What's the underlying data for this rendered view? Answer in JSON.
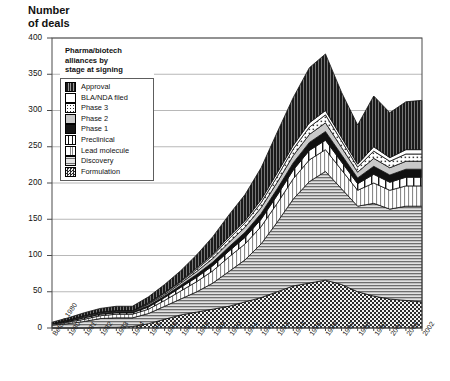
{
  "axis_title": "Number\nof deals",
  "legend": {
    "title": "Pharma/biotech\nalliances by\nstage at signing",
    "items": [
      {
        "label": "Approval",
        "pattern": "vstripe-dark"
      },
      {
        "label": "BLA/NDA filed",
        "pattern": "white"
      },
      {
        "label": "Phase 3",
        "pattern": "dot-grid"
      },
      {
        "label": "Phase 2",
        "pattern": "light-gray"
      },
      {
        "label": "Phase 1",
        "pattern": "solid-black"
      },
      {
        "label": "Preclinical",
        "pattern": "wide-vbar"
      },
      {
        "label": "Lead molecule",
        "pattern": "vstripe-light"
      },
      {
        "label": "Discovery",
        "pattern": "hstripe"
      },
      {
        "label": "Formulation",
        "pattern": "checker"
      }
    ]
  },
  "chart_data": {
    "type": "area",
    "title": "Pharma/biotech alliances by stage at signing",
    "xlabel": "",
    "ylabel": "Number of deals",
    "ylim": [
      0,
      400
    ],
    "yticks": [
      0,
      50,
      100,
      150,
      200,
      250,
      300,
      350,
      400
    ],
    "grid": true,
    "stacked": true,
    "legend_position": "upper-left-inside",
    "categories": [
      "Before 1980",
      "1980",
      "1981",
      "1982",
      "1983",
      "1984",
      "1985",
      "1986",
      "1987",
      "1988",
      "1989",
      "1990",
      "1991",
      "1992",
      "1993",
      "1994",
      "1995",
      "1996",
      "1997",
      "1998",
      "1999",
      "2000",
      "2001",
      "2002"
    ],
    "series": [
      {
        "name": "Formulation",
        "values": [
          0,
          0,
          0,
          1,
          1,
          2,
          6,
          12,
          18,
          22,
          26,
          30,
          36,
          42,
          50,
          58,
          62,
          66,
          60,
          50,
          44,
          40,
          38,
          36
        ]
      },
      {
        "name": "Discovery",
        "values": [
          4,
          6,
          9,
          12,
          13,
          12,
          14,
          18,
          22,
          28,
          36,
          48,
          58,
          74,
          96,
          120,
          140,
          150,
          132,
          118,
          128,
          124,
          130,
          132
        ]
      },
      {
        "name": "Lead molecule",
        "values": [
          1,
          2,
          3,
          4,
          5,
          5,
          6,
          8,
          11,
          14,
          17,
          20,
          22,
          24,
          26,
          28,
          30,
          30,
          26,
          22,
          28,
          26,
          28,
          28
        ]
      },
      {
        "name": "Preclinical",
        "values": [
          1,
          1,
          2,
          2,
          2,
          2,
          3,
          4,
          5,
          6,
          7,
          8,
          9,
          10,
          11,
          12,
          13,
          13,
          11,
          9,
          12,
          11,
          12,
          12
        ]
      },
      {
        "name": "Phase 1",
        "values": [
          0,
          1,
          1,
          1,
          1,
          1,
          2,
          2,
          3,
          4,
          5,
          6,
          7,
          8,
          9,
          10,
          11,
          12,
          10,
          8,
          11,
          10,
          11,
          11
        ]
      },
      {
        "name": "Phase 2",
        "values": [
          0,
          1,
          1,
          1,
          1,
          1,
          2,
          2,
          3,
          4,
          5,
          6,
          7,
          8,
          9,
          10,
          11,
          12,
          10,
          8,
          11,
          10,
          11,
          11
        ]
      },
      {
        "name": "Phase 3",
        "values": [
          0,
          0,
          1,
          1,
          1,
          1,
          1,
          2,
          2,
          3,
          4,
          5,
          6,
          7,
          8,
          9,
          10,
          11,
          9,
          7,
          10,
          9,
          10,
          10
        ]
      },
      {
        "name": "BLA/NDA filed",
        "values": [
          0,
          0,
          0,
          0,
          0,
          0,
          1,
          1,
          1,
          2,
          2,
          3,
          3,
          4,
          5,
          5,
          6,
          6,
          5,
          4,
          6,
          5,
          6,
          6
        ]
      },
      {
        "name": "Approval",
        "values": [
          2,
          3,
          4,
          5,
          6,
          6,
          8,
          11,
          14,
          18,
          24,
          30,
          36,
          44,
          56,
          66,
          76,
          78,
          62,
          54,
          70,
          62,
          66,
          68
        ]
      }
    ]
  }
}
